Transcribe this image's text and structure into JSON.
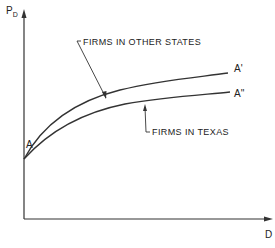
{
  "diagram": {
    "y_axis_label": "P",
    "y_axis_label_subscript": "D",
    "x_axis_label": "D",
    "origin_point_label": "A",
    "curves": [
      {
        "name": "firms-in-other-states",
        "label": "FIRMS IN OTHER STATES",
        "end_label": "A'",
        "position": "upper"
      },
      {
        "name": "firms-in-texas",
        "label": "FIRMS IN TEXAS",
        "end_label": "A''",
        "position": "lower"
      }
    ],
    "colors": {
      "line": "#333333",
      "background": "#ffffff"
    }
  }
}
